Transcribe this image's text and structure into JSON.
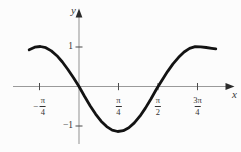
{
  "figure": {
    "background_color": "#fcfcfc",
    "axis_color": "#9a9a9a",
    "tick_color": "#4a4a4a",
    "arrow_color": "#2b2b2b",
    "label_color": "#333333",
    "curve_color": "#131313"
  },
  "chart_data": {
    "type": "line",
    "title": "",
    "xlabel": "x",
    "ylabel": "y",
    "x_unit": "radians",
    "xlim": [
      -1.31,
      3.0
    ],
    "ylim": [
      -1.45,
      1.95
    ],
    "grid": false,
    "x_ticks": [
      {
        "value_pi": -0.25,
        "prefix": "−",
        "numerator": "π",
        "denominator": "4"
      },
      {
        "value_pi": 0.25,
        "prefix": "",
        "numerator": "π",
        "denominator": "4"
      },
      {
        "value_pi": 0.5,
        "prefix": "",
        "numerator": "π",
        "denominator": "2"
      },
      {
        "value_pi": 0.75,
        "prefix": "",
        "numerator": "3π",
        "denominator": "4"
      }
    ],
    "y_ticks": [
      {
        "value": 1,
        "label": "1"
      },
      {
        "value": -1,
        "label": "−1"
      }
    ],
    "series": [
      {
        "name": "curve",
        "description": "y = -sin(2x) as drawn",
        "points": [
          [
            -0.99,
            0.917
          ],
          [
            -0.88,
            0.982
          ],
          [
            -0.77,
            0.9995
          ],
          [
            -0.66,
            0.969
          ],
          [
            -0.55,
            0.891
          ],
          [
            -0.44,
            0.771
          ],
          [
            -0.33,
            0.613
          ],
          [
            -0.22,
            0.426
          ],
          [
            -0.11,
            0.218
          ],
          [
            0,
            0
          ],
          [
            0.11,
            -0.218
          ],
          [
            0.22,
            -0.426
          ],
          [
            0.33,
            -0.613
          ],
          [
            0.44,
            -0.771
          ],
          [
            0.55,
            -0.891
          ],
          [
            0.66,
            -0.969
          ],
          [
            0.77,
            -0.9995
          ],
          [
            0.88,
            -0.982
          ],
          [
            0.99,
            -0.917
          ],
          [
            1.1,
            -0.809
          ],
          [
            1.21,
            -0.661
          ],
          [
            1.32,
            -0.481
          ],
          [
            1.43,
            -0.278
          ],
          [
            1.54,
            -0.062
          ],
          [
            1.65,
            0.158
          ],
          [
            1.76,
            0.372
          ],
          [
            1.87,
            0.565
          ],
          [
            1.98,
            0.729
          ],
          [
            2.09,
            0.863
          ],
          [
            2.2,
            0.952
          ],
          [
            2.31,
            0.997
          ],
          [
            2.42,
            0.992
          ],
          [
            2.53,
            0.975
          ],
          [
            2.64,
            0.955
          ],
          [
            2.72,
            0.94
          ]
        ]
      }
    ]
  }
}
